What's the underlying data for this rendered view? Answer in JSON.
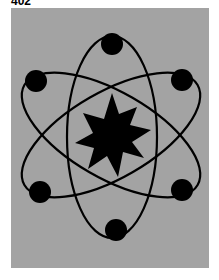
{
  "caption": "402",
  "colors": {
    "background": "#a3a3a3",
    "figure": "#000000"
  },
  "figure": {
    "center": [
      112,
      135
    ],
    "star": {
      "points": 10,
      "outer_radius": 42,
      "inner_radius": 22
    },
    "orbits": [
      {
        "rx": 45,
        "ry": 102,
        "rotate": 0
      },
      {
        "rx": 45,
        "ry": 102,
        "rotate": 60
      },
      {
        "rx": 45,
        "ry": 102,
        "rotate": -60
      }
    ],
    "electrons": [
      {
        "x": 112,
        "y": 43
      },
      {
        "x": 182,
        "y": 79
      },
      {
        "x": 182,
        "y": 191
      },
      {
        "x": 116,
        "y": 230
      },
      {
        "x": 40,
        "y": 192
      },
      {
        "x": 36,
        "y": 81
      }
    ]
  }
}
